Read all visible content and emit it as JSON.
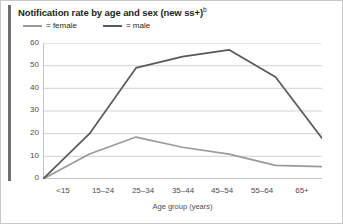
{
  "chart_data": {
    "type": "line",
    "title": "Notification rate by age and sex (new ss+)",
    "title_superscript": "b",
    "xlabel": "Age group (years)",
    "ylabel": "",
    "categories": [
      "<15",
      "15–24",
      "25–34",
      "35–44",
      "45–54",
      "55–64",
      "65+"
    ],
    "series": [
      {
        "name": "female",
        "color": "#9a9a9a",
        "values": [
          0,
          11,
          18.5,
          14,
          11,
          6,
          5.5
        ]
      },
      {
        "name": "male",
        "color": "#595959",
        "values": [
          0,
          20,
          49,
          54,
          57,
          45,
          18
        ]
      }
    ],
    "ylim": [
      0,
      60
    ],
    "yticks": [
      0,
      10,
      20,
      30,
      40,
      50,
      60
    ],
    "ytick_labels": [
      "0",
      "10",
      "20",
      "30",
      "40",
      "50",
      "60"
    ],
    "grid": true,
    "grid_axis": "y",
    "legend_position": "top-left",
    "legend_entries": [
      {
        "label": "= female",
        "color": "#9a9a9a"
      },
      {
        "label": "= male",
        "color": "#595959"
      }
    ]
  },
  "figure": {
    "background_color": "#ffffff",
    "border_color": "#c8c8c8",
    "rule_color": "#6e6e6e",
    "grid_color": "#d2d2d2",
    "axis_color": "#9a9a9a",
    "text_color": "#231f20",
    "tick_text_color": "#4d4d4d"
  }
}
